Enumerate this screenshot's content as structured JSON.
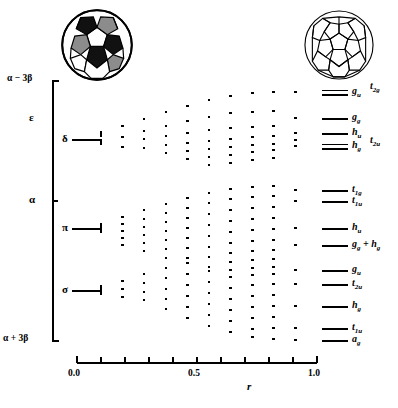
{
  "figure": {
    "type": "correlation-diagram",
    "title": "",
    "icons": {
      "left": "soccer-ball-icon",
      "right": "fullerene-cage-icon"
    }
  },
  "yaxis": {
    "top_label": "α − 3β",
    "bottom_label": "α + 3β",
    "mid_label": "α",
    "shell_labels": [
      {
        "text": "ε",
        "y": 118
      },
      {
        "text": "δ",
        "y": 139
      },
      {
        "text": "π",
        "y": 228
      },
      {
        "text": "σ",
        "y": 290
      }
    ]
  },
  "xaxis": {
    "label": "r",
    "ticks": [
      "0.0",
      "0.5",
      "1.0"
    ],
    "tick_positions": [
      0.0,
      0.5,
      1.0
    ],
    "minor_ticks": 10,
    "range": [
      0.0,
      1.0
    ]
  },
  "levels": [
    {
      "label": "g",
      "sub": "u",
      "y": 92,
      "span": 2
    },
    {
      "label": "t",
      "sub": "2g",
      "y": 92,
      "span": 0,
      "offset": true
    },
    {
      "label": "g",
      "sub": "g",
      "y": 118,
      "span": 1
    },
    {
      "label": "h",
      "sub": "u",
      "y": 133,
      "span": 2
    },
    {
      "label": "h",
      "sub": "g",
      "y": 146,
      "span": 2
    },
    {
      "label": "t",
      "sub": "2u",
      "y": 140,
      "span": 0,
      "offset": true
    },
    {
      "label": "t",
      "sub": "1g",
      "y": 190,
      "span": 1
    },
    {
      "label": "t",
      "sub": "1u",
      "y": 201,
      "span": 1
    },
    {
      "label": "h",
      "sub": "u",
      "y": 228,
      "span": 1
    },
    {
      "label": "g",
      "sub": "g",
      "y": 245,
      "span": 1,
      "extra": "+ h"
    },
    {
      "label": "g",
      "sub": "u",
      "y": 270,
      "span": 1
    },
    {
      "label": "t",
      "sub": "2u",
      "y": 284,
      "span": 1
    },
    {
      "label": "h",
      "sub": "g",
      "y": 306,
      "span": 1
    },
    {
      "label": "t",
      "sub": "1u",
      "y": 328,
      "span": 1
    },
    {
      "label": "a",
      "sub": "g",
      "y": 340,
      "span": 1
    }
  ],
  "chart_data": {
    "type": "scatter",
    "xlabel": "r",
    "ylabel": "Energy",
    "xlim": [
      0.0,
      1.0
    ],
    "ylim": [
      "α + 3β",
      "α − 3β"
    ],
    "grid": false,
    "legend": "none",
    "columns": [
      {
        "r": 0.02,
        "kind": "line",
        "levels": [
          139,
          228,
          290
        ]
      },
      {
        "r": 0.1,
        "kind": "bar",
        "levels": [
          134,
          142,
          226,
          230,
          288,
          292
        ]
      },
      {
        "r": 0.19,
        "levels": [
          126,
          137,
          147,
          217,
          224,
          231,
          238,
          245,
          281,
          289,
          297
        ]
      },
      {
        "r": 0.28,
        "levels": [
          119,
          131,
          139,
          148,
          210,
          219,
          227,
          235,
          243,
          251,
          274,
          283,
          292,
          300
        ]
      },
      {
        "r": 0.37,
        "levels": [
          112,
          126,
          136,
          145,
          153,
          204,
          213,
          222,
          231,
          240,
          249,
          258,
          268,
          278,
          289,
          299,
          309
        ]
      },
      {
        "r": 0.46,
        "levels": [
          106,
          121,
          133,
          143,
          151,
          159,
          198,
          208,
          218,
          228,
          238,
          248,
          258,
          263,
          274,
          285,
          296,
          307,
          318
        ]
      },
      {
        "r": 0.55,
        "levels": [
          100,
          117,
          130,
          141,
          149,
          157,
          165,
          193,
          203,
          214,
          225,
          236,
          247,
          257,
          267,
          271,
          282,
          293,
          304,
          315,
          326
        ]
      },
      {
        "r": 0.64,
        "levels": [
          96,
          113,
          128,
          139,
          147,
          155,
          163,
          189,
          199,
          210,
          221,
          232,
          243,
          253,
          262,
          270,
          277,
          288,
          299,
          310,
          321,
          332
        ]
      },
      {
        "r": 0.73,
        "levels": [
          93,
          112,
          127,
          137,
          145,
          152,
          160,
          187,
          197,
          208,
          219,
          230,
          241,
          251,
          260,
          268,
          275,
          285,
          296,
          307,
          318,
          329,
          337
        ]
      },
      {
        "r": 0.82,
        "levels": [
          92,
          111,
          126,
          136,
          144,
          150,
          158,
          186,
          196,
          207,
          218,
          229,
          240,
          250,
          259,
          267,
          274,
          284,
          295,
          306,
          317,
          328,
          339
        ]
      },
      {
        "r": 0.91,
        "levels": [
          92,
          118,
          133,
          140,
          146,
          190,
          201,
          228,
          245,
          270,
          284,
          306,
          328,
          340
        ]
      }
    ],
    "final_levels": [
      {
        "y": 92,
        "terms": [
          "g_u",
          "t_2g"
        ]
      },
      {
        "y": 118,
        "terms": [
          "g_g"
        ]
      },
      {
        "y": 133,
        "terms": [
          "h_u"
        ]
      },
      {
        "y": 146,
        "terms": [
          "h_g",
          "t_2u"
        ]
      },
      {
        "y": 190,
        "terms": [
          "t_1g"
        ]
      },
      {
        "y": 201,
        "terms": [
          "t_1u"
        ]
      },
      {
        "y": 228,
        "terms": [
          "h_u"
        ]
      },
      {
        "y": 245,
        "terms": [
          "g_g + h_g"
        ]
      },
      {
        "y": 270,
        "terms": [
          "g_u"
        ]
      },
      {
        "y": 284,
        "terms": [
          "t_2u"
        ]
      },
      {
        "y": 306,
        "terms": [
          "h_g"
        ]
      },
      {
        "y": 328,
        "terms": [
          "t_1u"
        ]
      },
      {
        "y": 340,
        "terms": [
          "a_g"
        ]
      }
    ]
  }
}
